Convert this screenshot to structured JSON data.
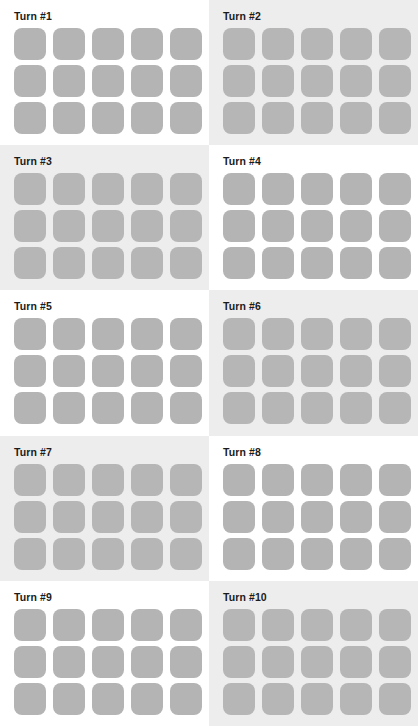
{
  "page": {
    "layout": {
      "columns": 2,
      "rows": 5,
      "panel_count": 10
    },
    "colors": {
      "page_background": "#ffffff",
      "panel_shaded_background": "#ededed",
      "panel_plain_background": "#ffffff",
      "tile_fill": "#b4b4b4",
      "label_text": "#1b1b1b"
    },
    "board": {
      "columns": 5,
      "rows": 3,
      "cell_count": 15,
      "tile_shape": "rounded-square"
    }
  },
  "panels": [
    {
      "label": "Turn #1",
      "turn": 1,
      "shaded": false,
      "tiles": 15
    },
    {
      "label": "Turn #2",
      "turn": 2,
      "shaded": true,
      "tiles": 15
    },
    {
      "label": "Turn #3",
      "turn": 3,
      "shaded": true,
      "tiles": 15
    },
    {
      "label": "Turn #4",
      "turn": 4,
      "shaded": false,
      "tiles": 15
    },
    {
      "label": "Turn #5",
      "turn": 5,
      "shaded": false,
      "tiles": 15
    },
    {
      "label": "Turn #6",
      "turn": 6,
      "shaded": true,
      "tiles": 15
    },
    {
      "label": "Turn #7",
      "turn": 7,
      "shaded": true,
      "tiles": 15
    },
    {
      "label": "Turn #8",
      "turn": 8,
      "shaded": false,
      "tiles": 15
    },
    {
      "label": "Turn #9",
      "turn": 9,
      "shaded": false,
      "tiles": 15
    },
    {
      "label": "Turn #10",
      "turn": 10,
      "shaded": true,
      "tiles": 15
    }
  ]
}
